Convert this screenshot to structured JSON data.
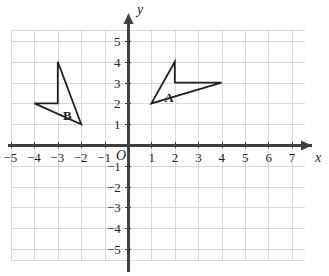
{
  "chart_data": {
    "type": "scatter",
    "title": "",
    "xlabel": "x",
    "ylabel": "y",
    "grid": true,
    "legend": "none",
    "xlim": [
      -5,
      7
    ],
    "ylim": [
      -5,
      5
    ],
    "x_ticks": [
      -5,
      -4,
      -3,
      -2,
      -1,
      1,
      2,
      3,
      4,
      5,
      6,
      7
    ],
    "y_ticks": [
      5,
      4,
      3,
      2,
      1,
      -1,
      -2,
      -3,
      -4,
      -5
    ],
    "x_tick_labels": [
      "−5",
      "−4",
      "−3",
      "−2",
      "−1",
      "1",
      "2",
      "3",
      "4",
      "5",
      "6",
      "7"
    ],
    "y_tick_labels": [
      "5",
      "4",
      "3",
      "2",
      "1",
      "−1",
      "−2",
      "−3",
      "−4",
      "−5"
    ],
    "origin_label": "O",
    "series": [
      {
        "name": "A",
        "label": "A",
        "label_position": [
          1.55,
          2.62
        ],
        "closed": true,
        "points": [
          [
            1,
            2
          ],
          [
            2,
            4
          ],
          [
            2,
            3
          ],
          [
            4,
            3
          ]
        ]
      },
      {
        "name": "B",
        "label": "B",
        "label_position": [
          -2.78,
          1.72
        ],
        "closed": true,
        "points": [
          [
            -4,
            2
          ],
          [
            -3,
            2
          ],
          [
            -3,
            4
          ],
          [
            -2,
            1
          ]
        ]
      }
    ],
    "annotations": []
  },
  "style": {
    "grid_color": "#d8d8da",
    "axis_color": "#3f3f44",
    "shape_color": "#231f20",
    "background": "#ffffff"
  }
}
